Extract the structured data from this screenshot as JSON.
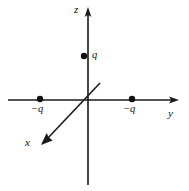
{
  "figure": {
    "kind": "physics-diagram",
    "width": 189,
    "height": 191,
    "background_color": "#ffffff",
    "line_color": "#1a1a1a",
    "text_color": "#111111"
  },
  "axes": [
    {
      "name": "z",
      "label": "z",
      "orientation": "vertical",
      "arrow": "up",
      "origin": [
        88,
        100
      ],
      "arrow_tip": [
        88,
        8
      ],
      "tail": [
        88,
        185
      ]
    },
    {
      "name": "y",
      "label": "y",
      "orientation": "horizontal",
      "arrow": "right",
      "origin": [
        88,
        100
      ],
      "arrow_tip": [
        178,
        100
      ],
      "tail": [
        8,
        100
      ]
    },
    {
      "name": "x",
      "label": "x",
      "orientation": "diagonal-down-left",
      "arrow": "down-left",
      "origin": [
        88,
        100
      ],
      "arrow_tip": [
        42,
        143
      ],
      "tail": [
        100,
        83
      ]
    }
  ],
  "charges": [
    {
      "id": "charge-positive-z",
      "label": "q",
      "sign": "positive",
      "on_axis": "z",
      "position": [
        84,
        56
      ],
      "dot_radius": 3
    },
    {
      "id": "charge-negative-y-left",
      "label": "−q",
      "sign": "negative",
      "on_axis": "y",
      "position": [
        40,
        99
      ],
      "dot_radius": 3
    },
    {
      "id": "charge-negative-y-right",
      "label": "−q",
      "sign": "negative",
      "on_axis": "y",
      "position": [
        132,
        99
      ],
      "dot_radius": 3
    }
  ]
}
